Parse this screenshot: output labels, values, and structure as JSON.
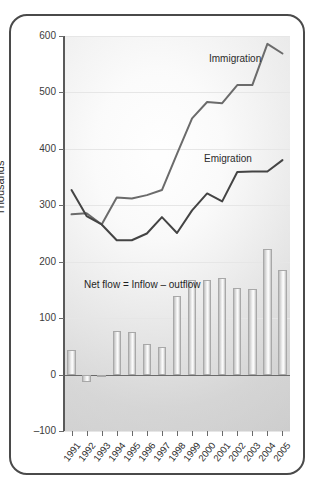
{
  "chart_data": {
    "type": "line",
    "title": "",
    "subtitle": "",
    "xlabel": "",
    "ylabel": "Thousands",
    "categories": [
      "1991",
      "1992",
      "1993",
      "1994",
      "1995",
      "1996",
      "1997",
      "1998",
      "1999",
      "2000",
      "2001",
      "2002",
      "2003",
      "2004",
      "2005"
    ],
    "ylim": [
      -100,
      600
    ],
    "yticks": [
      -100,
      0,
      100,
      200,
      300,
      400,
      500,
      600
    ],
    "ytick_labels": [
      "–100",
      "0",
      "100",
      "200",
      "300",
      "400",
      "500",
      "600"
    ],
    "grid": true,
    "legend_position": "inline-annotation",
    "series": [
      {
        "name": "Immigration",
        "type": "line",
        "color": "#6b6b6b",
        "values": [
          284,
          286,
          266,
          314,
          312,
          318,
          327,
          391,
          454,
          483,
          481,
          513,
          513,
          586,
          569
        ]
      },
      {
        "name": "Emigration",
        "type": "line",
        "color": "#444444",
        "values": [
          327,
          281,
          266,
          238,
          238,
          250,
          279,
          251,
          291,
          321,
          307,
          359,
          360,
          360,
          380
        ]
      },
      {
        "name": "Net flow",
        "type": "bar",
        "color": "#cfcfcf",
        "values": [
          43,
          -13,
          -3,
          77,
          76,
          55,
          48,
          140,
          167,
          167,
          172,
          153,
          151,
          223,
          185
        ]
      }
    ],
    "annotations": [
      {
        "name": "net-flow-formula",
        "text": "Net flow = Inflow – outflow"
      },
      {
        "name": "immigration-label",
        "text": "Immigration"
      },
      {
        "name": "emigration-label",
        "text": "Emigration"
      }
    ],
    "colors": {
      "frame": "#4a4a4a",
      "axis": "#5a5a5a",
      "grid": "#e6e6e6",
      "immigration_line": "#6b6b6b",
      "emigration_line": "#444444",
      "bar_fill": "#dcdcdc",
      "text": "#2e2e2e"
    }
  }
}
